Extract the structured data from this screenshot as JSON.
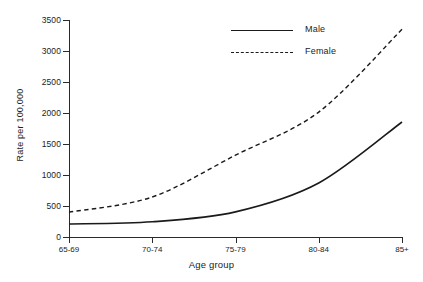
{
  "chart_data": {
    "type": "line",
    "title": "",
    "xlabel": "Age group",
    "ylabel": "Rate per 100,000",
    "categories": [
      "65-69",
      "70-74",
      "75-79",
      "80-84",
      "85+"
    ],
    "series": [
      {
        "name": "Male",
        "style": "solid",
        "values": [
          210,
          245,
          405,
          870,
          1855
        ]
      },
      {
        "name": "Female",
        "style": "dashed",
        "values": [
          400,
          645,
          1320,
          2015,
          3350
        ]
      }
    ],
    "ylim": [
      0,
      3500
    ],
    "yticks": [
      0,
      500,
      1000,
      1500,
      2000,
      2500,
      3000,
      3500
    ],
    "ytick_labels": [
      "0",
      "500",
      "1000",
      "1500",
      "2000",
      "2500",
      "3000",
      "3500"
    ],
    "grid": false,
    "legend_position": "top-center",
    "line_color": "#1a1a1a"
  },
  "legend": {
    "entries": [
      {
        "label": "Male"
      },
      {
        "label": "Female"
      }
    ]
  }
}
